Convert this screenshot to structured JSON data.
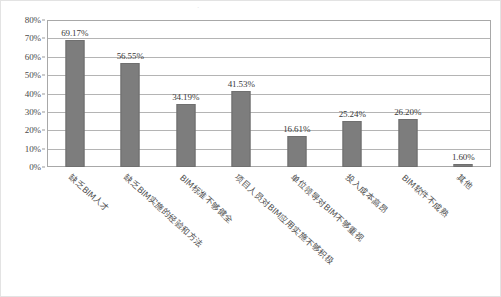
{
  "chart_data": {
    "type": "bar",
    "title": "",
    "xlabel": "",
    "ylabel": "",
    "ylim": [
      0,
      80
    ],
    "grid": true,
    "legend": "none",
    "y_tick_labels": [
      "80%",
      "70%",
      "60%",
      "50%",
      "40%",
      "30%",
      "20%",
      "10%",
      "0%"
    ],
    "y_tick_values": [
      80,
      70,
      60,
      50,
      40,
      30,
      20,
      10,
      0
    ],
    "categories": [
      "缺乏BIM人才",
      "缺乏BIM实施的经验和方法",
      "BIM标准不够健全",
      "项目人员对BIM应用实施不够积极",
      "单位领导对BIM不够重视",
      "投入成本高昂",
      "BIM软件不成熟",
      "其他"
    ],
    "values": [
      69.17,
      56.55,
      34.19,
      41.53,
      16.61,
      25.24,
      26.2,
      1.6
    ],
    "value_labels": [
      "69.17%",
      "56.55%",
      "34.19%",
      "41.53%",
      "16.61%",
      "25.24%",
      "26.20%",
      "1.60%"
    ],
    "bar_color": "#7d7d7d",
    "grid_color": "#b4b4b4",
    "axis_color": "#a8a8a8"
  },
  "page_mark": "·"
}
